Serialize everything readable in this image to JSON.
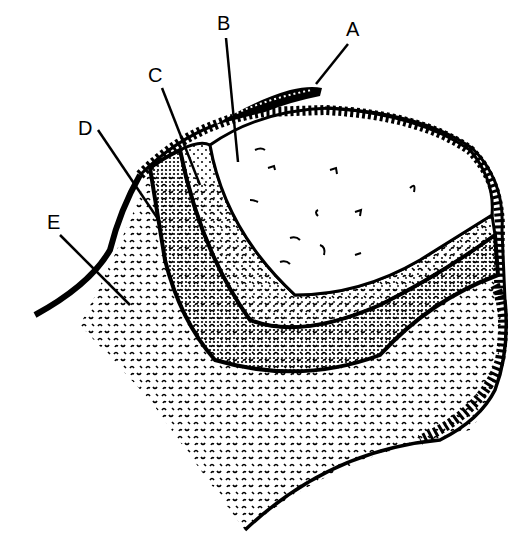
{
  "diagram": {
    "type": "labeled cross-section illustration",
    "style": "black and white line drawing with stipple textures",
    "labels": [
      {
        "id": "A",
        "text": "A",
        "x": 354,
        "y": 36,
        "target": "outer hatched layer fragment (top)",
        "leader": [
          [
            348,
            44
          ],
          [
            316,
            84
          ]
        ]
      },
      {
        "id": "B",
        "text": "B",
        "x": 224,
        "y": 28,
        "target": "inner cavity / core region",
        "leader": [
          [
            226,
            38
          ],
          [
            238,
            162
          ]
        ]
      },
      {
        "id": "C",
        "text": "C",
        "x": 155,
        "y": 78,
        "target": "light stippled layer",
        "leader": [
          [
            162,
            88
          ],
          [
            200,
            185
          ]
        ]
      },
      {
        "id": "D",
        "text": "D",
        "x": 85,
        "y": 132,
        "target": "dense dotted layer",
        "leader": [
          [
            98,
            130
          ],
          [
            160,
            222
          ]
        ]
      },
      {
        "id": "E",
        "text": "E",
        "x": 53,
        "y": 225,
        "target": "outer textured tissue",
        "leader": [
          [
            60,
            235
          ],
          [
            130,
            305
          ]
        ]
      }
    ],
    "colors": {
      "ink": "#000000",
      "background": "#ffffff"
    }
  }
}
